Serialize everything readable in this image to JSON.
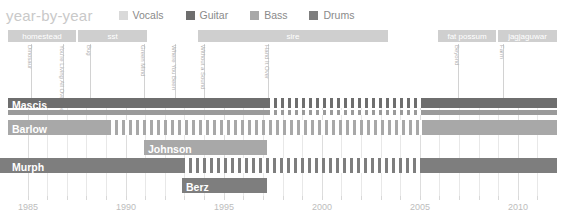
{
  "title": "year-by-year",
  "colors": {
    "vocals": "#d9d9d9",
    "guitar": "#6e6e6e",
    "bass": "#a8a8a8",
    "drums": "#7e7e7e",
    "label_bar": "#cfcfcf",
    "grid": "#e8e8e8",
    "axis_text": "#bdbdbd",
    "title_text": "#c9c9c9"
  },
  "legend": {
    "position": "top",
    "items": [
      {
        "label": "Vocals",
        "color": "#d9d9d9",
        "swatch": "square"
      },
      {
        "label": "Guitar",
        "color": "#6e6e6e",
        "swatch": "square"
      },
      {
        "label": "Bass",
        "color": "#a8a8a8",
        "swatch": "square"
      },
      {
        "label": "Drums",
        "color": "#7e7e7e",
        "swatch": "square"
      }
    ]
  },
  "record_labels": [
    {
      "name": "homestead",
      "x": 8,
      "w": 68
    },
    {
      "name": "sst",
      "x": 78,
      "w": 69
    },
    {
      "name": "sire",
      "x": 198,
      "w": 190
    },
    {
      "name": "fat possum",
      "x": 438,
      "w": 58
    },
    {
      "name": "jagjaguwar",
      "x": 498,
      "w": 59
    }
  ],
  "albums": [
    {
      "name": "Dinosaur",
      "x": 31
    },
    {
      "name": "You're Living All Over Me",
      "x": 63
    },
    {
      "name": "Bug",
      "x": 90
    },
    {
      "name": "Green Mind",
      "x": 144
    },
    {
      "name": "Where You Been",
      "x": 175
    },
    {
      "name": "Without a Sound",
      "x": 204
    },
    {
      "name": "Hand It Over",
      "x": 268
    },
    {
      "name": "Beyond",
      "x": 458
    },
    {
      "name": "Farm",
      "x": 503
    }
  ],
  "chart_data": {
    "type": "timeline",
    "title": "year-by-year",
    "xlabel": "",
    "ylabel": "",
    "xlim": [
      1984,
      2012
    ],
    "x_ticks": [
      1985,
      1986,
      1987,
      1988,
      1989,
      1990,
      1991,
      1992,
      1993,
      1994,
      1995,
      1996,
      1997,
      1998,
      1999,
      2000,
      2001,
      2002,
      2003,
      2004,
      2005,
      2006,
      2007,
      2008,
      2009,
      2010,
      2011
    ],
    "x_tick_labels": [
      1985,
      1990,
      1995,
      2000,
      2005,
      2010
    ],
    "grid": true,
    "rows": [
      {
        "name": "Mascis",
        "label": "Mascis",
        "top": 0,
        "height": 10,
        "segments": [
          {
            "role": "Guitar",
            "color": "#6e6e6e",
            "x": 8,
            "w": 259,
            "style": "solid"
          },
          {
            "role": "Guitar",
            "color": "#6e6e6e",
            "x": 267,
            "w": 155,
            "style": "hatched"
          },
          {
            "role": "Guitar",
            "color": "#6e6e6e",
            "x": 422,
            "w": 135,
            "style": "solid"
          }
        ]
      },
      {
        "name": "Mascis-vocals",
        "label": "",
        "top": 12,
        "height": 5,
        "segments": [
          {
            "role": "Vocals",
            "color": "#9a9a9a",
            "x": 8,
            "w": 259,
            "style": "solid"
          },
          {
            "role": "Vocals",
            "color": "#9a9a9a",
            "x": 267,
            "w": 155,
            "style": "hatched"
          },
          {
            "role": "Vocals",
            "color": "#9a9a9a",
            "x": 422,
            "w": 135,
            "style": "solid"
          }
        ]
      },
      {
        "name": "Barlow",
        "label": "Barlow",
        "top": 22,
        "height": 15,
        "segments": [
          {
            "role": "Bass",
            "color": "#a8a8a8",
            "x": 8,
            "w": 100,
            "style": "solid"
          },
          {
            "role": "Bass",
            "color": "#a8a8a8",
            "x": 108,
            "w": 314,
            "style": "hatched"
          },
          {
            "role": "Bass",
            "color": "#a8a8a8",
            "x": 422,
            "w": 135,
            "style": "solid"
          }
        ]
      },
      {
        "name": "Johnson",
        "label": "Johnson",
        "top": 42,
        "height": 15,
        "segments": [
          {
            "role": "Bass",
            "color": "#a8a8a8",
            "x": 144,
            "w": 123,
            "style": "solid"
          }
        ]
      },
      {
        "name": "Murph",
        "label": "Murph",
        "top": 60,
        "height": 15,
        "segments": [
          {
            "role": "Drums",
            "color": "#7e7e7e",
            "x": 0,
            "w": 182,
            "style": "solid"
          },
          {
            "role": "Drums",
            "color": "#7e7e7e",
            "x": 182,
            "w": 240,
            "style": "hatched"
          },
          {
            "role": "Drums",
            "color": "#7e7e7e",
            "x": 422,
            "w": 135,
            "style": "solid"
          }
        ]
      },
      {
        "name": "Berz",
        "label": "Berz",
        "top": 80,
        "height": 15,
        "segments": [
          {
            "role": "Drums",
            "color": "#7e7e7e",
            "x": 182,
            "w": 85,
            "style": "solid"
          }
        ]
      }
    ],
    "row_label_positions": [
      {
        "name": "Mascis",
        "x": 12,
        "y": 0
      },
      {
        "name": "Barlow",
        "x": 12,
        "y": 24
      },
      {
        "name": "Johnson",
        "x": 148,
        "y": 44
      },
      {
        "name": "Murph",
        "x": 12,
        "y": 62
      },
      {
        "name": "Berz",
        "x": 186,
        "y": 82
      }
    ]
  }
}
